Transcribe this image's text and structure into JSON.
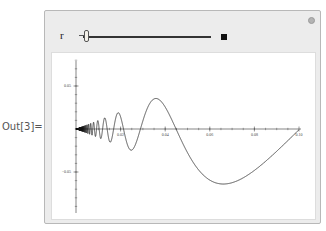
{
  "output_label": "Out[3]=",
  "manipulate": {
    "control": {
      "label": "r",
      "slider_position": 0.03
    },
    "options_icon": "gear-icon"
  },
  "chart_data": {
    "type": "line",
    "title": "",
    "xlabel": "",
    "ylabel": "",
    "function": "y = x*sin(1/x)-like oscillation with linearly growing amplitude",
    "xlim": [
      0,
      0.1
    ],
    "ylim": [
      -0.1,
      0.1
    ],
    "x_ticks": [
      "0.02",
      "0.04",
      "0.06",
      "0.08",
      "0.10"
    ],
    "y_ticks": [
      "0.05",
      "-0.05"
    ],
    "grid": false,
    "series": [
      {
        "name": "curve",
        "color": "#000000"
      }
    ]
  }
}
